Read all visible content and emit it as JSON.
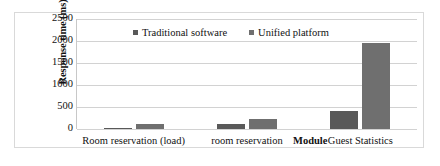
{
  "chart_data": {
    "type": "bar",
    "title": "",
    "xlabel": "Module",
    "ylabel": "Response time (ms)",
    "categories": [
      "Room reservation (load)",
      "room reservation",
      "Guest Statistics"
    ],
    "series": [
      {
        "name": "Traditional software",
        "values": [
          30,
          120,
          420
        ],
        "color": "#595959"
      },
      {
        "name": "Unified platform",
        "values": [
          120,
          230,
          1960
        ],
        "color": "#6f6f6f"
      }
    ],
    "ylim": [
      0,
      2500
    ],
    "yticks": [
      0,
      500,
      1000,
      1500,
      2000,
      2500
    ],
    "ytick_labels": [
      "0",
      "500",
      "1000",
      "1500",
      "2000",
      "2500"
    ],
    "grid": true,
    "legend_position": "top-center"
  }
}
